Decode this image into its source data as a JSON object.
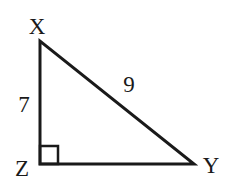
{
  "diagram": {
    "type": "right-triangle",
    "vertices": [
      {
        "label": "X",
        "x": 40,
        "y": 41
      },
      {
        "label": "Z",
        "x": 40,
        "y": 164
      },
      {
        "label": "Y",
        "x": 194,
        "y": 164
      }
    ],
    "right_angle_at": "Z",
    "sides": [
      {
        "between": "XZ",
        "label": "7"
      },
      {
        "between": "XY",
        "label": "9"
      },
      {
        "between": "ZY",
        "label": ""
      }
    ],
    "colors": {
      "stroke": "#1a1a1a",
      "background": "#ffffff"
    }
  },
  "labels": {
    "vertex_x": "X",
    "vertex_z": "Z",
    "vertex_y": "Y",
    "side_xz": "7",
    "side_xy": "9"
  }
}
